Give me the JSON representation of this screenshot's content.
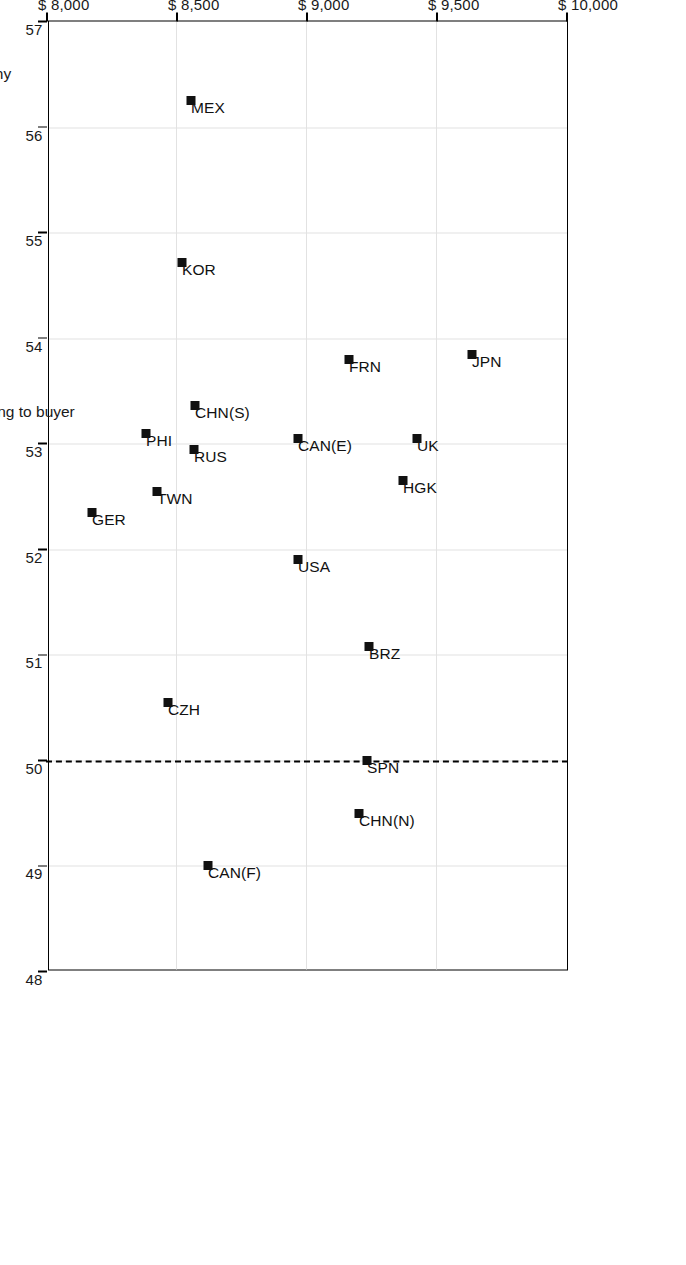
{
  "chart_data": {
    "type": "scatter",
    "title": "",
    "xlabel": "Percentage of profits going to buyer",
    "ylabel": "Joint profits",
    "xlim": [
      48,
      57
    ],
    "ylim": [
      8000,
      10000
    ],
    "grid": true,
    "legend": "none",
    "x_ticks": [
      "48",
      "49",
      "50",
      "51",
      "52",
      "53",
      "54",
      "55",
      "56",
      "57"
    ],
    "x_tick_values": [
      48,
      49,
      50,
      51,
      52,
      53,
      54,
      55,
      56,
      57
    ],
    "y_ticks": [
      "$ 8,000",
      "$ 8,500",
      "$ 9,000",
      "$ 9,500",
      "$ 10,000"
    ],
    "y_tick_values": [
      8000,
      8500,
      9000,
      9500,
      10000
    ],
    "x_axis_annotations": [
      {
        "label": "Equity",
        "value": 50
      },
      {
        "label": "Hierarchy",
        "value": 56.5
      }
    ],
    "y_axis_annotations": [
      {
        "label": "Cooperative",
        "value": 10000
      },
      {
        "label": "Competitive",
        "value": 8000
      }
    ],
    "reference_line": {
      "label": "Equity",
      "orientation": "vertical",
      "value": 50,
      "style": "dashed"
    },
    "points": [
      {
        "label": "JPN",
        "x": 53.85,
        "y": 9635
      },
      {
        "label": "FRN",
        "x": 53.8,
        "y": 9160
      },
      {
        "label": "UK",
        "x": 53.05,
        "y": 9425
      },
      {
        "label": "HGK",
        "x": 52.65,
        "y": 9370
      },
      {
        "label": "CAN(E)",
        "x": 53.05,
        "y": 8965
      },
      {
        "label": "CHN(S)",
        "x": 53.36,
        "y": 8570
      },
      {
        "label": "RUS",
        "x": 52.95,
        "y": 8565
      },
      {
        "label": "PHI",
        "x": 53.1,
        "y": 8380
      },
      {
        "label": "TWN",
        "x": 52.55,
        "y": 8425
      },
      {
        "label": "GER",
        "x": 52.35,
        "y": 8175
      },
      {
        "label": "KOR",
        "x": 54.72,
        "y": 8520
      },
      {
        "label": "MEX",
        "x": 56.25,
        "y": 8555
      },
      {
        "label": "USA",
        "x": 51.9,
        "y": 8965
      },
      {
        "label": "BRZ",
        "x": 51.08,
        "y": 9240
      },
      {
        "label": "SPN",
        "x": 50.0,
        "y": 9230
      },
      {
        "label": "CHN(N)",
        "x": 49.5,
        "y": 9200
      },
      {
        "label": "CZH",
        "x": 50.55,
        "y": 8465
      },
      {
        "label": "CAN(F)",
        "x": 49.0,
        "y": 8620
      }
    ]
  }
}
